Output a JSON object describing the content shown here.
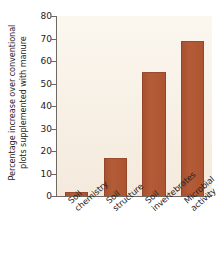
{
  "chart_data": {
    "type": "bar",
    "title": "",
    "xlabel": "",
    "ylabel": "Percentage increase over conventional\nplots supplemented with manure",
    "categories": [
      "Soil\nchemistry",
      "Soil\nstructure",
      "Soil\ninvertebrates",
      "Microbial\nactivity"
    ],
    "values": [
      2,
      17,
      55,
      69
    ],
    "ylim": [
      0,
      80
    ],
    "yticks": [
      0,
      10,
      20,
      30,
      40,
      50,
      60,
      70,
      80
    ],
    "ytick_labels": [
      "0",
      "10",
      "20",
      "30",
      "40",
      "50",
      "60",
      "70",
      "80"
    ],
    "grid": false,
    "legend": "none",
    "bar_color": "#b05a36",
    "plot_background": "#f8f1e6",
    "axis_color": "#6e6962",
    "text_color": "#26211e"
  }
}
